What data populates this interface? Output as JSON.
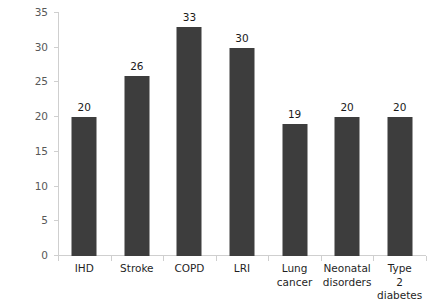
{
  "chart_data": {
    "type": "bar",
    "title": "",
    "xlabel": "",
    "ylabel": "Global deaths (%",
    "categories": [
      "IHD",
      "Stroke",
      "COPD",
      "LRI",
      "Lung cancer",
      "Neonatal disorders",
      "Type 2 diabetes"
    ],
    "values": [
      20,
      26,
      33,
      30,
      19,
      20,
      20
    ],
    "value_labels": [
      "20",
      "26",
      "33",
      "30",
      "19",
      "20",
      "20"
    ],
    "ylim": [
      0,
      35
    ],
    "ytick_values": [
      0,
      5,
      10,
      15,
      20,
      25,
      30,
      35
    ],
    "ytick_labels": [
      "0",
      "5",
      "10",
      "15",
      "20",
      "25",
      "30",
      "35"
    ],
    "grid": false,
    "legend": null,
    "bar_color": "#3d3d3d",
    "axis_color": "#cfcfcf",
    "tick_label_color": "#585858",
    "background": "#ffffff"
  }
}
